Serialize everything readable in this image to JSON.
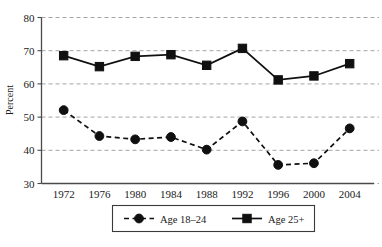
{
  "chart_data": {
    "type": "line",
    "title": "",
    "xlabel": "",
    "ylabel": "Percent",
    "categories": [
      "1972",
      "1976",
      "1980",
      "1984",
      "1988",
      "1992",
      "1996",
      "2000",
      "2004"
    ],
    "ylim": [
      30,
      80
    ],
    "yticks": [
      30,
      40,
      50,
      60,
      70,
      80
    ],
    "ytick_labels": [
      "30",
      "40",
      "50",
      "60",
      "70",
      "80"
    ],
    "grid": true,
    "legend_position": "bottom-center",
    "series": [
      {
        "name": "Age 18–24",
        "marker": "circle",
        "linestyle": "dashed",
        "color": "#101010",
        "values": [
          52.1,
          44.3,
          43.3,
          44.0,
          40.2,
          48.7,
          35.6,
          36.1,
          46.6
        ]
      },
      {
        "name": "Age 25+",
        "marker": "square",
        "linestyle": "solid",
        "color": "#101010",
        "values": [
          68.5,
          65.2,
          68.3,
          68.8,
          65.6,
          70.7,
          61.2,
          62.4,
          66.1
        ]
      }
    ]
  },
  "axis": {
    "y_title": "Percent"
  },
  "legend": {
    "entries": [
      {
        "label": "Age 18–24"
      },
      {
        "label": "Age 25+"
      }
    ]
  }
}
